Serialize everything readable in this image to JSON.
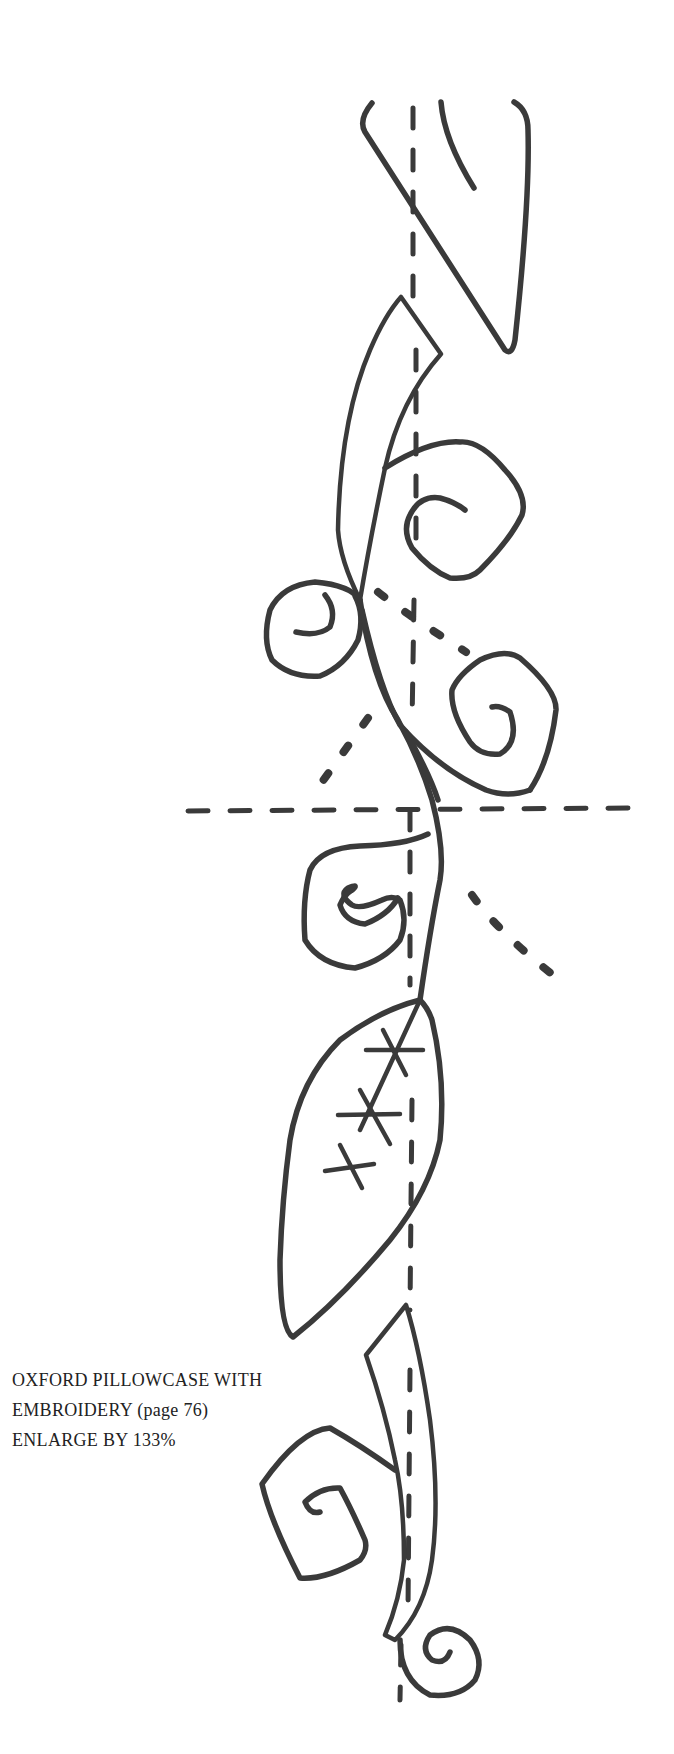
{
  "caption": {
    "line1": "OXFORD PILLOWCASE WITH",
    "line2": "EMBROIDERY (page 76)",
    "line3": "ENLARGE BY 133%"
  },
  "pattern": {
    "name": "vine-embroidery-template",
    "ink_color": "#3a3a3a",
    "background": "#ffffff"
  }
}
